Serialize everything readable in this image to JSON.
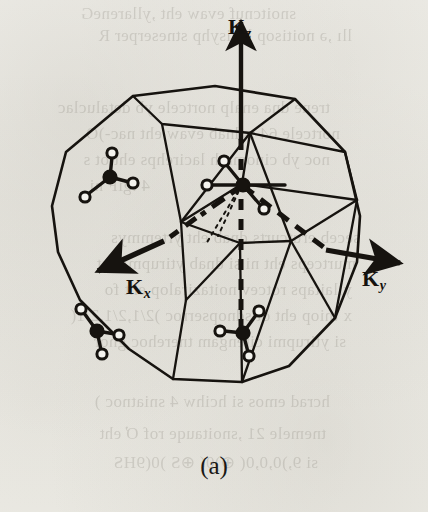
{
  "figure": {
    "caption": "(a)",
    "kind": "brillouin-zone-truncated-octahedron",
    "ink_color": "#16130f",
    "paper_color": "#f2f1ec"
  },
  "axes": [
    {
      "id": "kz",
      "symbol": "K",
      "subscript": "z",
      "direction": "up",
      "line_style": "dashed-inside-solid-outside",
      "label_x": 228,
      "label_y": 16
    },
    {
      "id": "kx",
      "symbol": "K",
      "subscript": "x",
      "direction": "down-left",
      "line_style": "dash-dot",
      "label_x": 126,
      "label_y": 276
    },
    {
      "id": "ky",
      "symbol": "K",
      "subscript": "y",
      "direction": "right",
      "line_style": "dashed",
      "label_x": 362,
      "label_y": 268
    }
  ],
  "symmetry_markers": [
    {
      "id": "marker-center",
      "name": "gamma-point-tetrahedron",
      "x": 242,
      "y": 184,
      "rotation": 0,
      "scale": 1.0,
      "visible_legs": 4
    },
    {
      "id": "marker-upper-left",
      "name": "face-center-tetrahedron-left",
      "x": 110,
      "y": 176,
      "rotation": 0,
      "scale": 1.0,
      "visible_legs": 3
    },
    {
      "id": "marker-lower-left",
      "name": "face-center-tetrahedron-lower-left",
      "x": 96,
      "y": 330,
      "rotation": 35,
      "scale": 1.0,
      "visible_legs": 3
    },
    {
      "id": "marker-lower-right",
      "name": "face-center-tetrahedron-lower-right",
      "x": 243,
      "y": 332,
      "rotation": 0,
      "scale": 1.0,
      "visible_legs": 3
    }
  ],
  "bleed_through_lines": [
    {
      "text": "snoitcnuf evaw eht ,yllareneG",
      "x": 296,
      "y": 4,
      "size": 17
    },
    {
      "text": "llı ,ǝ noitisop lacisyhp stneserper R",
      "x": 352,
      "y": 26,
      "size": 17
    },
    {
      "text": "trene dna enalp nortcele yb detaluclac",
      "x": 330,
      "y": 98,
      "size": 17
    },
    {
      "text": "nortcele 64 ,sdnab evaw eht nac-)O",
      "x": 340,
      "y": 124,
      "size": 17
    },
    {
      "text": "noc yb cinomrah lacirehps eht ot s",
      "x": 330,
      "y": 150,
      "size": 17
    },
    {
      "text": "4 .giF ni",
      "x": 150,
      "y": 176,
      "size": 17
    },
    {
      "text": "seceb erutcurts dnab eht yrtemmys",
      "x": 360,
      "y": 228,
      "size": 17
    },
    {
      "text": "murtceps eht ni si dnab ytirupmi eht",
      "x": 356,
      "y": 254,
      "size": 17
    },
    {
      "text": "yllaitaps rotcev noitaziralop eht fo",
      "x": 352,
      "y": 280,
      "size": 17
    },
    {
      "text": "x tniop eht ot sdnopserroc )2/1,2/1,2/1(",
      "x": 352,
      "y": 306,
      "size": 17
    },
    {
      "text": "si ytirupmi citengam tnerehoc gnor",
      "x": 346,
      "y": 332,
      "size": 17
    },
    {
      "text": "hcrad emos si hcihw 4 sniatnoc )",
      "x": 330,
      "y": 392,
      "size": 17
    },
    {
      "text": "tnemele 21 ,snoitauqe rof Ơ eht",
      "x": 326,
      "y": 424,
      "size": 17
    },
    {
      "text": "si 9,)0,0,0( ⊕)0( ⊕S )0(9HS",
      "x": 318,
      "y": 452,
      "size": 17
    }
  ]
}
